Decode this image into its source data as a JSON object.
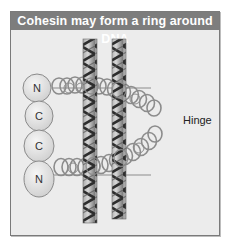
{
  "figure": {
    "title": "Cohesin may form a ring around DNA",
    "labels": {
      "hinge": "Hinge",
      "domains": [
        "N",
        "C",
        "C",
        "N"
      ]
    },
    "colors": {
      "title_bar": "#7d7d7d",
      "title_text": "#ffffff",
      "background": "#ececec",
      "frame_border": "#7a7a7a",
      "domain_fill": "#e4e4e4",
      "coil_stroke": "#8c8c8c",
      "dna_dark": "#3a3a3a",
      "dna_light": "#b8b8b8"
    }
  }
}
